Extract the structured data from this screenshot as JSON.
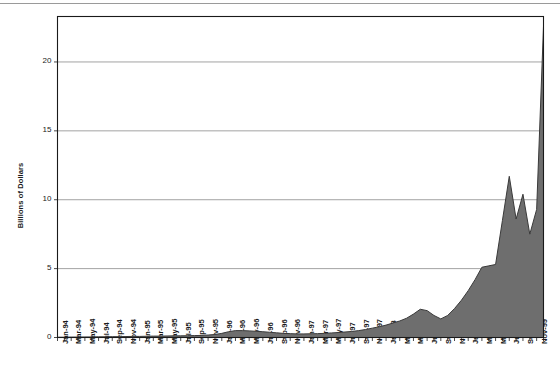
{
  "chart_data": {
    "type": "area",
    "title": "",
    "subtitle": "",
    "xlabel": "",
    "ylabel": "Billions of Dollars",
    "ylim": [
      0,
      23.3
    ],
    "yticks": [
      0,
      5,
      10,
      15,
      20
    ],
    "ytick_labels": [
      "0",
      "5",
      "10",
      "15",
      "20"
    ],
    "grid": "horizontal",
    "legend": "none",
    "series_name": "Billions of Dollars",
    "fill_color": "#6e6e6e",
    "line_color": "#3a3a3a",
    "axis_color": "#1a1a1a",
    "grid_color": "#8c8c8c",
    "background_color": "#ffffff",
    "categories": [
      "Jan-94",
      "Feb-94",
      "Mar-94",
      "Apr-94",
      "May-94",
      "Jun-94",
      "Jul-94",
      "Aug-94",
      "Sep-94",
      "Oct-94",
      "Nov-94",
      "Dec-94",
      "Jan-95",
      "Feb-95",
      "Mar-95",
      "Apr-95",
      "May-95",
      "Jun-95",
      "Jul-95",
      "Aug-95",
      "Sep-95",
      "Oct-95",
      "Nov-95",
      "Dec-95",
      "Jan-96",
      "Feb-96",
      "Mar-96",
      "Apr-96",
      "May-96",
      "Jun-96",
      "Jul-96",
      "Aug-96",
      "Sep-96",
      "Oct-96",
      "Nov-96",
      "Dec-96",
      "Jan-97",
      "Feb-97",
      "Mar-97",
      "Apr-97",
      "May-97",
      "Jun-97",
      "Jul-97",
      "Aug-97",
      "Sep-97",
      "Oct-97",
      "Nov-97",
      "Dec-97",
      "Jan-98",
      "Feb-98",
      "Mar-98",
      "Apr-98",
      "May-98",
      "Jun-98",
      "Jul-98",
      "Aug-98",
      "Sep-98",
      "Oct-98",
      "Nov-98",
      "Dec-98",
      "Jan-99",
      "Feb-99",
      "Mar-99",
      "Apr-99",
      "May-99",
      "Jun-99",
      "Jul-99",
      "Aug-99",
      "Sep-99",
      "Oct-99",
      "Nov-99",
      "Dec-99"
    ],
    "xtick_labels": [
      "Jan-94",
      "Mar-94",
      "May-94",
      "Jul-94",
      "Sep-94",
      "Nov-94",
      "Jan-95",
      "Mar-95",
      "May-95",
      "Jul-95",
      "Sep-95",
      "Nov-95",
      "Jan-96",
      "Mar-96",
      "May-96",
      "Jul-96",
      "Sep-96",
      "Nov-96",
      "Jan-97",
      "Mar-97",
      "May-97",
      "Jul-97",
      "Sep-97",
      "Nov-97",
      "Jan-98",
      "Mar-98",
      "May-98",
      "Jul-98",
      "Sep-98",
      "Nov-98",
      "Jan-99",
      "Mar-99",
      "May-99",
      "Jul-99",
      "Sep-99",
      "Nov-99"
    ],
    "xtick_indices": [
      0,
      2,
      4,
      6,
      8,
      10,
      12,
      14,
      16,
      18,
      20,
      22,
      24,
      26,
      28,
      30,
      32,
      34,
      36,
      38,
      40,
      42,
      44,
      46,
      48,
      50,
      52,
      54,
      56,
      58,
      60,
      62,
      64,
      66,
      68,
      70
    ],
    "values": [
      0.02,
      0.02,
      0.03,
      0.03,
      0.04,
      0.04,
      0.05,
      0.05,
      0.06,
      0.06,
      0.07,
      0.08,
      0.08,
      0.09,
      0.1,
      0.1,
      0.11,
      0.12,
      0.12,
      0.13,
      0.14,
      0.15,
      0.18,
      0.22,
      0.3,
      0.42,
      0.5,
      0.5,
      0.48,
      0.45,
      0.42,
      0.38,
      0.34,
      0.3,
      0.28,
      0.26,
      0.26,
      0.27,
      0.28,
      0.3,
      0.33,
      0.36,
      0.4,
      0.44,
      0.5,
      0.58,
      0.68,
      0.78,
      0.9,
      1.05,
      1.2,
      1.4,
      1.7,
      2.05,
      1.95,
      1.6,
      1.35,
      1.6,
      2.1,
      2.7,
      3.4,
      4.2,
      5.1,
      5.2,
      5.3,
      8.5,
      11.7,
      8.6,
      10.4,
      7.5,
      9.3,
      22.6
    ]
  }
}
